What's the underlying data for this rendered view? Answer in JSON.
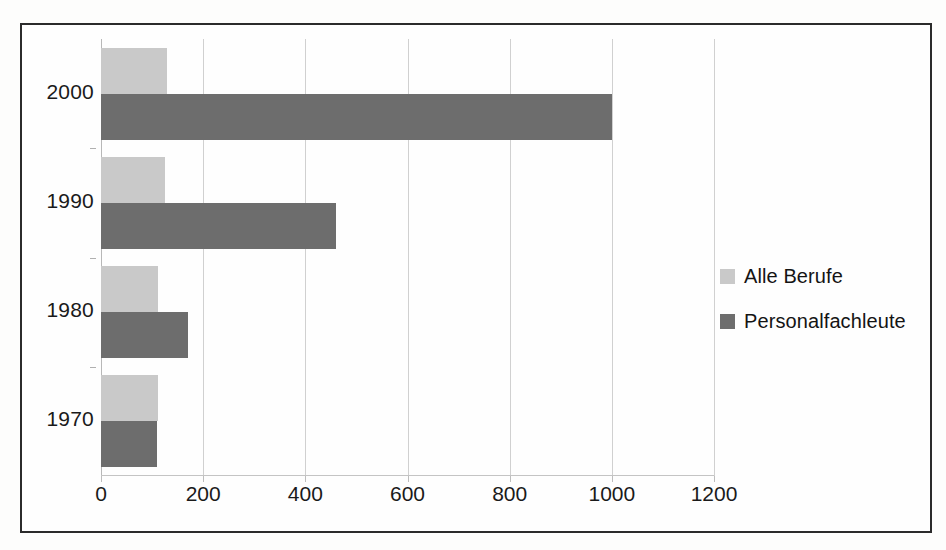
{
  "chart_data": {
    "type": "bar",
    "orientation": "horizontal",
    "title": "",
    "xlabel": "",
    "ylabel": "",
    "categories": [
      "2000",
      "1990",
      "1980",
      "1970"
    ],
    "series": [
      {
        "name": "Alle Berufe",
        "color": "#c9c9c9",
        "values": [
          130,
          125,
          112,
          112
        ]
      },
      {
        "name": "Personalfachleute",
        "color": "#6d6d6d",
        "values": [
          1000,
          460,
          170,
          110
        ]
      }
    ],
    "xlim": [
      0,
      1200
    ],
    "xticks": [
      0,
      200,
      400,
      600,
      800,
      1000,
      1200
    ],
    "xticklabels": [
      "0",
      "200",
      "400",
      "600",
      "800",
      "1000",
      "1200"
    ],
    "grid": "vertical",
    "legend_position": "right"
  },
  "legend": {
    "entries": [
      {
        "label": "Alle Berufe"
      },
      {
        "label": "Personalfachleute"
      }
    ]
  },
  "frame": {
    "border_color": "#2b2b2b",
    "background": "#fefefe"
  }
}
